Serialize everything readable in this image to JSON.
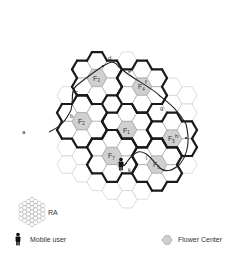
{
  "diagram": {
    "type": "hexagonal cellular network with flower clusters and mobile user path",
    "colors": {
      "flower_center_fill": "#d0d0d0",
      "cell_stroke": "#bdbdbd",
      "boundary_stroke": "#1a1a1a",
      "path_stroke": "#222222"
    },
    "flower_centers": [
      {
        "id": "F1",
        "label": "F",
        "sub": "1"
      },
      {
        "id": "F2",
        "label": "F",
        "sub": "2"
      },
      {
        "id": "F3",
        "label": "F",
        "sub": "3"
      },
      {
        "id": "F4",
        "label": "F",
        "sub": "4"
      },
      {
        "id": "F5",
        "label": "F",
        "sub": "5"
      },
      {
        "id": "F6",
        "label": "F",
        "sub": "6"
      },
      {
        "id": "F7",
        "label": "F",
        "sub": "7"
      }
    ],
    "path_labels": [
      "a",
      "b",
      "c",
      "d",
      "e",
      "f",
      "g",
      "h",
      "i",
      "j",
      "k"
    ]
  },
  "legend": {
    "ra_label": "RA",
    "mobile_user_label": "Mobile user",
    "flower_center_label": "Flower  Center"
  }
}
